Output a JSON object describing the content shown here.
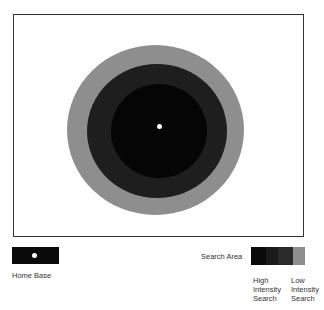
{
  "diagram": {
    "home_base_position": "center",
    "zones": [
      {
        "name": "inner",
        "color": "#050505"
      },
      {
        "name": "middle",
        "color": "#1e1e1e"
      },
      {
        "name": "outer",
        "color": "#8e8e8e"
      }
    ]
  },
  "legend": {
    "home_base": {
      "label": "Home Base",
      "swatch_color": "#0a0a0a",
      "dot_color": "#ffffff"
    },
    "search_area": {
      "label": "Search Area",
      "gradient": [
        "#0a0a0a",
        "#1e1e1e",
        "#2a2a2a",
        "#8e8e8e"
      ],
      "high_label_line1": "High",
      "high_label_line2": "Intensity",
      "high_label_line3": "Search",
      "low_label_line1": "Low",
      "low_label_line2": "Intensity",
      "low_label_line3": "Search"
    }
  }
}
